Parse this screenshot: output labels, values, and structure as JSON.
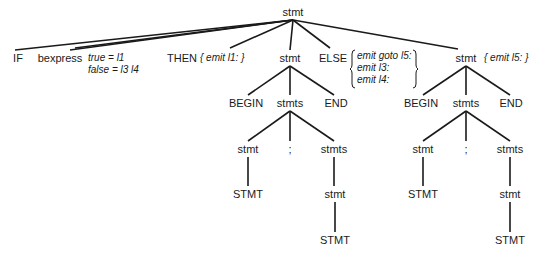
{
  "tree": {
    "root": "stmt",
    "level1": [
      "IF",
      "bexpress",
      "THEN",
      "stmt",
      "ELSE",
      "stmt"
    ],
    "bexpress_attrs": [
      "true = l1",
      "false = l3 l4"
    ],
    "then_action": "{ emit l1: }",
    "else_actions": [
      "emit goto l5:",
      "emit l3:",
      "emit l4:"
    ],
    "right_stmt_action": "{ emit l5: }",
    "left_subtree": {
      "stmt": "stmt",
      "children": [
        "BEGIN",
        "stmts",
        "END"
      ],
      "stmts_children": [
        "stmt",
        ";",
        "stmts"
      ],
      "leaf_stmt": "STMT",
      "inner_stmt": "stmt",
      "inner_leaf": "STMT"
    },
    "right_subtree": {
      "stmt": "stmt",
      "children": [
        "BEGIN",
        "stmts",
        "END"
      ],
      "stmts_children": [
        "stmt",
        ";",
        "stmts"
      ],
      "leaf_stmt": "STMT",
      "inner_stmt": "stmt",
      "inner_leaf": "STMT"
    }
  },
  "colors": {
    "line": "#1a1a1a",
    "background": "#ffffff"
  }
}
